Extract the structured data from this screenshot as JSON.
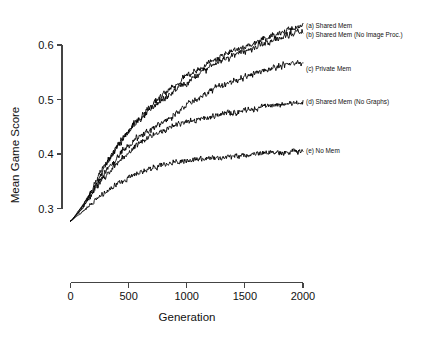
{
  "chart_data": {
    "type": "line",
    "title": "",
    "xlabel": "Generation",
    "ylabel": "Mean Game Score",
    "xlim": [
      0,
      2000
    ],
    "ylim": [
      0.26,
      0.65
    ],
    "xticks": [
      0,
      500,
      1000,
      1500,
      2000
    ],
    "xtick_labels": [
      "0",
      "500",
      "1000",
      "1500",
      "2000"
    ],
    "yticks": [
      0.3,
      0.4,
      0.5,
      0.6
    ],
    "ytick_labels": [
      "0.3",
      "0.4",
      "0.5",
      "0.6"
    ],
    "grid": false,
    "legend_position": "right-inline-labels",
    "line_color": "#000000",
    "background": "#ffffff",
    "x": [
      0,
      50,
      100,
      150,
      200,
      250,
      300,
      350,
      400,
      450,
      500,
      550,
      600,
      650,
      700,
      750,
      800,
      850,
      900,
      950,
      1000,
      1050,
      1100,
      1150,
      1200,
      1250,
      1300,
      1350,
      1400,
      1450,
      1500,
      1550,
      1600,
      1650,
      1700,
      1750,
      1800,
      1850,
      1900,
      1950,
      2000
    ],
    "series": [
      {
        "name": "(a) Shared Mem",
        "label": "(a) Shared Mem",
        "label_y": 0.636,
        "values": [
          0.277,
          0.29,
          0.305,
          0.322,
          0.341,
          0.362,
          0.381,
          0.398,
          0.414,
          0.43,
          0.443,
          0.456,
          0.468,
          0.479,
          0.49,
          0.5,
          0.51,
          0.519,
          0.527,
          0.535,
          0.543,
          0.55,
          0.557,
          0.563,
          0.569,
          0.574,
          0.579,
          0.584,
          0.589,
          0.593,
          0.597,
          0.601,
          0.605,
          0.609,
          0.613,
          0.617,
          0.621,
          0.625,
          0.629,
          0.633,
          0.636
        ]
      },
      {
        "name": "(b) Shared Mem (No Image Proc.)",
        "label": "(b) Shared Mem (No Image Proc.)",
        "label_y": 0.619,
        "values": [
          0.277,
          0.288,
          0.301,
          0.317,
          0.336,
          0.357,
          0.377,
          0.395,
          0.412,
          0.427,
          0.441,
          0.453,
          0.464,
          0.474,
          0.483,
          0.492,
          0.5,
          0.508,
          0.516,
          0.524,
          0.531,
          0.539,
          0.546,
          0.553,
          0.559,
          0.565,
          0.57,
          0.575,
          0.58,
          0.585,
          0.589,
          0.593,
          0.597,
          0.601,
          0.605,
          0.609,
          0.613,
          0.617,
          0.62,
          0.623,
          0.626
        ]
      },
      {
        "name": "(c) Private Mem",
        "label": "(c) Private Mem",
        "label_y": 0.556,
        "values": [
          0.277,
          0.289,
          0.303,
          0.319,
          0.335,
          0.351,
          0.366,
          0.38,
          0.393,
          0.405,
          0.416,
          0.425,
          0.433,
          0.44,
          0.447,
          0.453,
          0.459,
          0.466,
          0.473,
          0.481,
          0.489,
          0.496,
          0.503,
          0.509,
          0.515,
          0.52,
          0.525,
          0.53,
          0.534,
          0.538,
          0.542,
          0.546,
          0.55,
          0.553,
          0.556,
          0.559,
          0.562,
          0.564,
          0.566,
          0.567,
          0.566
        ]
      },
      {
        "name": "(d) Shared Mem (No Graphs)",
        "label": "(d) Shared Mem (No Graphs)",
        "label_y": 0.497,
        "values": [
          0.277,
          0.288,
          0.3,
          0.314,
          0.329,
          0.344,
          0.358,
          0.371,
          0.383,
          0.394,
          0.404,
          0.413,
          0.421,
          0.428,
          0.434,
          0.44,
          0.445,
          0.449,
          0.453,
          0.456,
          0.459,
          0.462,
          0.464,
          0.466,
          0.468,
          0.47,
          0.472,
          0.474,
          0.476,
          0.478,
          0.48,
          0.482,
          0.484,
          0.486,
          0.488,
          0.489,
          0.491,
          0.492,
          0.493,
          0.494,
          0.496
        ]
      },
      {
        "name": "(e) No Mem",
        "label": "(e) No Mem",
        "label_y": 0.406,
        "values": [
          0.277,
          0.285,
          0.294,
          0.303,
          0.312,
          0.321,
          0.329,
          0.337,
          0.344,
          0.35,
          0.356,
          0.361,
          0.366,
          0.37,
          0.374,
          0.377,
          0.38,
          0.382,
          0.384,
          0.386,
          0.388,
          0.389,
          0.39,
          0.391,
          0.392,
          0.393,
          0.394,
          0.395,
          0.396,
          0.397,
          0.398,
          0.399,
          0.4,
          0.401,
          0.402,
          0.403,
          0.404,
          0.404,
          0.405,
          0.405,
          0.406
        ]
      }
    ]
  }
}
